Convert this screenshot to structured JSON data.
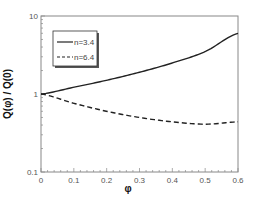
{
  "chart_data": {
    "type": "line",
    "title": "",
    "xlabel": "φ",
    "ylabel": "Q(φ) / Q(0)",
    "xlim": [
      0,
      0.6
    ],
    "ylim": [
      0.1,
      10
    ],
    "yscale": "log",
    "grid": false,
    "legend_position": "upper-left",
    "x": [
      0,
      0.1,
      0.2,
      0.3,
      0.4,
      0.5,
      0.6
    ],
    "x_ticks": [
      "0",
      "0.1",
      "0.2",
      "0.3",
      "0.4",
      "0.5",
      "0.6"
    ],
    "y_ticks": [
      "0.1",
      "1",
      "10"
    ],
    "series": [
      {
        "name": "n=3.4",
        "style": "solid",
        "color": "#222222",
        "values": [
          1.0,
          1.22,
          1.5,
          1.9,
          2.5,
          3.5,
          6.0
        ]
      },
      {
        "name": "n=6.4",
        "style": "dashed",
        "color": "#222222",
        "values": [
          1.0,
          0.76,
          0.6,
          0.5,
          0.44,
          0.41,
          0.44
        ]
      }
    ]
  }
}
